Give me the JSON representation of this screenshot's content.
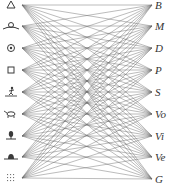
{
  "diagram": {
    "title": "",
    "line_color": "#6a6a6a",
    "ink_color": "#3a3a3a",
    "left_apex_x": 22,
    "right_apex_x": 152,
    "left_nodes": [
      {
        "id": "L0",
        "symbol": "triangle-icon",
        "y": 5
      },
      {
        "id": "L1",
        "symbol": "winged-orb-icon",
        "y": 26
      },
      {
        "id": "L2",
        "symbol": "concentric-circle-icon",
        "y": 48
      },
      {
        "id": "L3",
        "symbol": "square-icon",
        "y": 70
      },
      {
        "id": "L4",
        "symbol": "human-figure-icon",
        "y": 92
      },
      {
        "id": "L5",
        "symbol": "animal-icon",
        "y": 114
      },
      {
        "id": "L6",
        "symbol": "plant-icon",
        "y": 136
      },
      {
        "id": "L7",
        "symbol": "stone-icon",
        "y": 157
      },
      {
        "id": "L8",
        "symbol": "dots-icon",
        "y": 178
      }
    ],
    "right_nodes": [
      {
        "id": "R0",
        "label": "B",
        "y": 5
      },
      {
        "id": "R1",
        "label": "M",
        "y": 26
      },
      {
        "id": "R2",
        "label": "D",
        "y": 48
      },
      {
        "id": "R3",
        "label": "P",
        "y": 70
      },
      {
        "id": "R4",
        "label": "S",
        "y": 92
      },
      {
        "id": "R5",
        "label": "Vo",
        "y": 114
      },
      {
        "id": "R6",
        "label": "Vi",
        "y": 136
      },
      {
        "id": "R7",
        "label": "Ve",
        "y": 157
      },
      {
        "id": "R8",
        "label": "G",
        "y": 179
      }
    ],
    "connections": "complete-bipartite: every left node connects to every right node"
  }
}
